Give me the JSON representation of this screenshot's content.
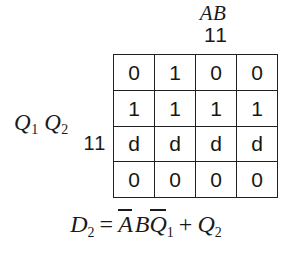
{
  "figure": {
    "type": "karnaugh-map",
    "column_variable_label": "AB",
    "column_bit_pattern": "11",
    "row_variable": {
      "letter_1": "Q",
      "subscript_1": "1",
      "letter_2": "Q",
      "subscript_2": "2"
    },
    "row_bit_pattern": "11",
    "grid": {
      "rows": 4,
      "columns": 4,
      "cells": [
        [
          "0",
          "1",
          "0",
          "0"
        ],
        [
          "1",
          "1",
          "1",
          "1"
        ],
        [
          "d",
          "d",
          "d",
          "d"
        ],
        [
          "0",
          "0",
          "0",
          "0"
        ]
      ]
    },
    "expression": {
      "output": "D",
      "output_subscript": "2",
      "equals": "=",
      "term1_var1": "A",
      "term1_var1_overbar": true,
      "term1_var2": "B",
      "term1_var2_overbar": false,
      "term1_var3": "Q",
      "term1_var3_subscript": "1",
      "term1_var3_overbar": true,
      "operator": "+",
      "term2_var": "Q",
      "term2_subscript": "2"
    },
    "colors": {
      "background": "#ffffff",
      "ink": "#1a1a1a",
      "grid_line": "#20201e"
    }
  }
}
